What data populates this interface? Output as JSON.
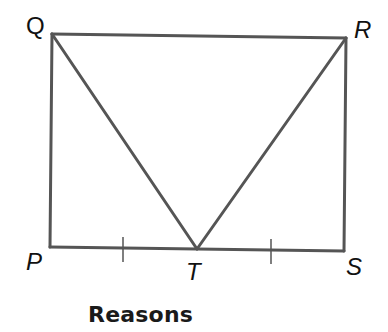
{
  "diagram": {
    "vertices": {
      "Q": {
        "label": "Q",
        "x": 52,
        "y": 34
      },
      "R": {
        "label": "R",
        "x": 346,
        "y": 38
      },
      "P": {
        "label": "P",
        "x": 50,
        "y": 247
      },
      "S": {
        "label": "S",
        "x": 344,
        "y": 251
      },
      "T": {
        "label": "T",
        "x": 197,
        "y": 249
      }
    },
    "segments": [
      "QR",
      "QP",
      "RS",
      "PS",
      "QT",
      "RT"
    ],
    "congruence_marks": [
      "PT",
      "TS"
    ],
    "stroke_color": "#555555"
  },
  "section": {
    "heading": "Reasons"
  }
}
